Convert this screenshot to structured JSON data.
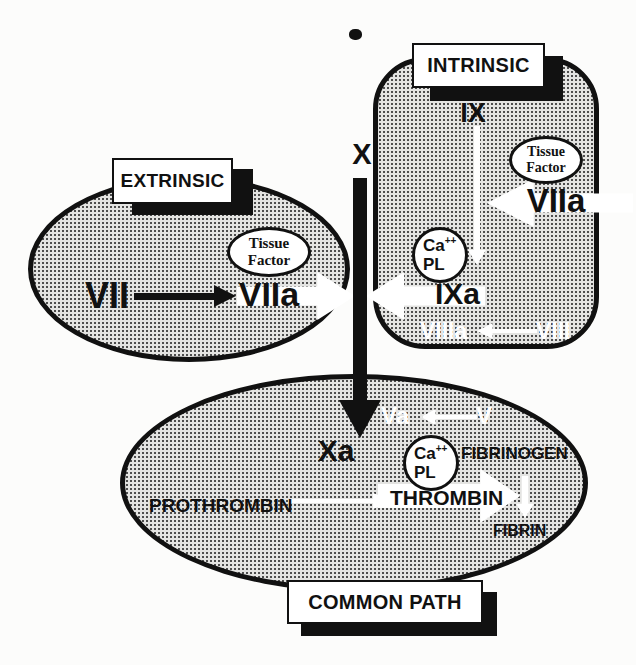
{
  "intrinsic": {
    "label": "INTRINSIC",
    "ix": "IX",
    "tissue_factor": {
      "line1": "Tissue",
      "line2": "Factor"
    },
    "viia": "VIIa",
    "ca": "Ca",
    "ca_sup": "++",
    "pl": "PL",
    "ixa": "IXa",
    "viiia": "VIIIa",
    "viii": "VIII"
  },
  "extrinsic": {
    "label": "EXTRINSIC",
    "vii": "VII",
    "viia": "VIIa",
    "tissue_factor": {
      "line1": "Tissue",
      "line2": "Factor"
    }
  },
  "common": {
    "label": "COMMON PATH",
    "x": "X",
    "xa": "Xa",
    "va": "Va",
    "v": "V",
    "ca": "Ca",
    "ca_sup": "++",
    "pl": "PL",
    "fibrinogen": "FIBRINOGEN",
    "prothrombin": "PROTHROMBIN",
    "thrombin": "THROMBIN",
    "fibrin": "FIBRIN"
  },
  "colors": {
    "ink": "#111111",
    "paper": "#fcfcfb",
    "shape_fill": "#c9c9c7",
    "white": "#ffffff"
  }
}
